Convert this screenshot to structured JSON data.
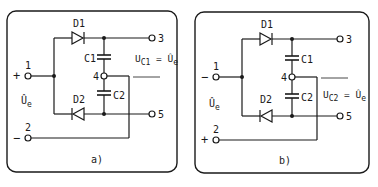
{
  "panels": [
    {
      "id": "a",
      "caption": "a)",
      "diode_top": "D1",
      "diode_bottom": "D2",
      "cap_top": "C1",
      "cap_bottom": "C2",
      "terminals": [
        "1",
        "2",
        "3",
        "4",
        "5"
      ],
      "polarity_top": "+",
      "polarity_bottom": "−",
      "input_voltage": "Û",
      "input_voltage_sub": "e",
      "output_label_main": "U",
      "output_label_sub": "C1",
      "output_label_eq": " = Û",
      "output_label_eq_sub": "e"
    },
    {
      "id": "b",
      "caption": "b)",
      "diode_top": "D1",
      "diode_bottom": "D2",
      "cap_top": "C1",
      "cap_bottom": "C2",
      "terminals": [
        "1",
        "2",
        "3",
        "4",
        "5"
      ],
      "polarity_top": "−",
      "polarity_bottom": "+",
      "input_voltage": "Û",
      "input_voltage_sub": "e",
      "output_label_main": "U",
      "output_label_sub": "C2",
      "output_label_eq": " = Û",
      "output_label_eq_sub": "e"
    }
  ],
  "colors": {
    "ink": "#1a1a1a",
    "background": "#ffffff"
  }
}
